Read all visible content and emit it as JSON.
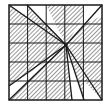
{
  "diagram": {
    "type": "hatched-grid-with-converging-lines",
    "grid": {
      "rows": 5,
      "cols": 5
    },
    "frame": {
      "x": 9,
      "y": 5,
      "width": 93,
      "height": 95
    },
    "colors": {
      "line": "#1a1a1a",
      "hatch": "#555555",
      "background": "#ffffff"
    },
    "focal_point": {
      "x": 66,
      "y": 45
    },
    "white_regions": [
      {
        "name": "top-left-triangle",
        "points": "9,5 27,5 27,16"
      },
      {
        "name": "top-wedge",
        "points": "27,5 46,5 66,45 46,24 34,14"
      },
      {
        "name": "top-right-wedge",
        "points": "84,5 102,5 102,16 84,24 66,45 84,16"
      },
      {
        "name": "bottom-left-wedge",
        "points": "9,86 46,62 66,45 27,81 9,100"
      },
      {
        "name": "bottom-center-wedge",
        "points": "66,45 72,100 84,100"
      },
      {
        "name": "bottom-right-triangle",
        "points": "84,81 102,100 84,100"
      }
    ],
    "rays": [
      {
        "x1": 9,
        "y1": 5,
        "x2": 66,
        "y2": 45
      },
      {
        "x1": 27,
        "y1": 5,
        "x2": 66,
        "y2": 45
      },
      {
        "x1": 102,
        "y1": 5,
        "x2": 66,
        "y2": 45
      },
      {
        "x1": 9,
        "y1": 86,
        "x2": 66,
        "y2": 45
      },
      {
        "x1": 9,
        "y1": 100,
        "x2": 66,
        "y2": 45
      },
      {
        "x1": 66,
        "y1": 45,
        "x2": 72,
        "y2": 100
      },
      {
        "x1": 66,
        "y1": 45,
        "x2": 84,
        "y2": 100
      },
      {
        "x1": 66,
        "y1": 45,
        "x2": 102,
        "y2": 100
      }
    ]
  }
}
